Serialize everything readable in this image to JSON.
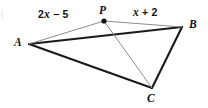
{
  "figure": {
    "background_color": "#ffffff",
    "thick_edge_color": "#1a1a1a",
    "thin_edge_color": "#8c8c8c",
    "vertex_dot_color": "#111111"
  },
  "points": {
    "A": {
      "label": "A",
      "x": 29,
      "y": 44,
      "label_x": 14,
      "label_y": 37
    },
    "B": {
      "label": "B",
      "x": 182,
      "y": 27,
      "label_x": 189,
      "label_y": 19
    },
    "C": {
      "label": "C",
      "x": 152,
      "y": 88,
      "label_x": 147,
      "label_y": 93
    },
    "P": {
      "label": "P",
      "x": 104,
      "y": 21,
      "label_x": 99,
      "label_y": 5,
      "dot_radius": 2.6
    }
  },
  "segments": [
    {
      "name": "segment-AB",
      "from": "A",
      "to": "B",
      "style": "thick"
    },
    {
      "name": "segment-AC",
      "from": "A",
      "to": "C",
      "style": "thick"
    },
    {
      "name": "segment-BC",
      "from": "B",
      "to": "C",
      "style": "thick"
    },
    {
      "name": "segment-AP",
      "from": "A",
      "to": "P",
      "style": "thin"
    },
    {
      "name": "segment-PB",
      "from": "P",
      "to": "B",
      "style": "thin"
    },
    {
      "name": "segment-PC",
      "from": "P",
      "to": "C",
      "style": "thin"
    }
  ],
  "labels": {
    "left_expression": {
      "prefix": "2",
      "variable": "x",
      "suffix": " − 5",
      "full": "2x − 5",
      "x": 38,
      "y": 9,
      "describes": "segment-AP"
    },
    "right_expression": {
      "prefix": "",
      "variable": "x",
      "suffix": " + 2",
      "full": "x + 2",
      "x": 133,
      "y": 7,
      "describes": "segment-PB"
    }
  }
}
